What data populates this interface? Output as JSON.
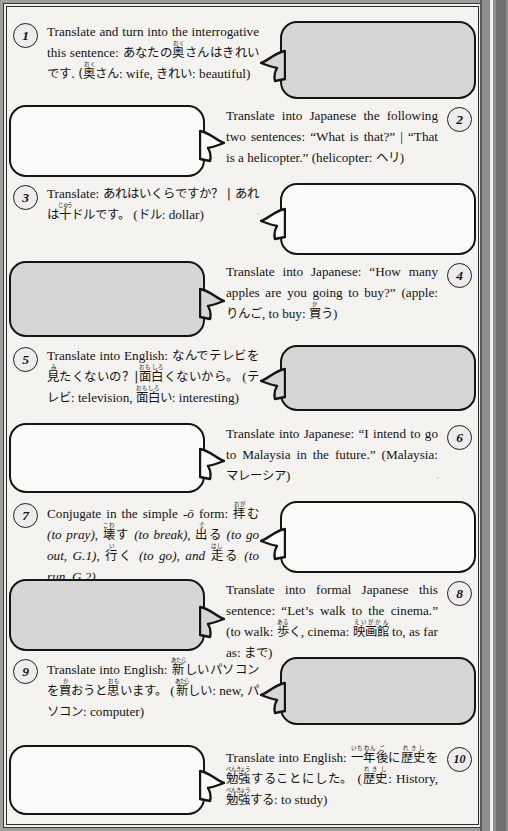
{
  "worksheet": {
    "title": "Japanese translation exercises",
    "bubble_fill_gray": "#d6d6d6",
    "bubble_fill_white": "#fbfbfa",
    "ink_color": "#151515",
    "page_background": "#f4f3f0"
  },
  "items": [
    {
      "number": "1",
      "side": "left",
      "bubble_fill": "gray",
      "answer_text": "",
      "prompt_html": "Translate and turn into the interrogative this sentence: <span class=\"jp\">あなたの<ruby>奥<rt>おく</rt></ruby>さんはきれいです.</span> <span class=\"jp\">(<ruby>奥<rt>おく</rt></ruby>さん</span>: wife, <span class=\"jp\">きれい</span>: beautiful)"
    },
    {
      "number": "2",
      "side": "right",
      "bubble_fill": "white",
      "answer_text": "",
      "prompt_html": "Translate into Japanese the following two sentences: &ldquo;What is that?&rdquo; | &ldquo;That is a helicopter.&rdquo; (helicopter: <span class=\"jp\">ヘリ</span>)"
    },
    {
      "number": "3",
      "side": "left",
      "bubble_fill": "white",
      "answer_text": "",
      "prompt_html": "Translate: <span class=\"jp\">あれはいくらですか？ | あれは<ruby>十<rt>じゅう</rt></ruby>ドルです。</span> (<span class=\"jp\">ドル</span>: dollar)"
    },
    {
      "number": "4",
      "side": "right",
      "bubble_fill": "gray",
      "answer_text": "",
      "prompt_html": "Translate into Japanese: &ldquo;How many apples are you going to buy?&rdquo; (apple: <span class=\"jp\">りんご</span>, to buy: <span class=\"jp\"><ruby>買<rt>か</rt></ruby>う</span>)"
    },
    {
      "number": "5",
      "side": "left",
      "bubble_fill": "gray",
      "answer_text": "",
      "prompt_html": "Translate into English: <span class=\"jp\">なんでテレビを<ruby>見<rt>み</rt></ruby>たくないの？|<ruby>面白<rt>おもしろ</rt></ruby>くないから。</span> (<span class=\"jp\">テレビ</span>: television, <span class=\"jp\"><ruby>面白<rt>おもしろ</rt></ruby>い</span>: interesting)"
    },
    {
      "number": "6",
      "side": "right",
      "bubble_fill": "white",
      "answer_text": "",
      "prompt_html": "Translate into Japanese: &ldquo;I intend to go to Malaysia in the future.&rdquo; (Malaysia: <span class=\"jp\">マレーシア</span>)"
    },
    {
      "number": "7",
      "side": "left",
      "bubble_fill": "white",
      "answer_text": "",
      "prompt_html": "Conjugate in the simple <span class=\"it\">-ō</span> form: <span class=\"jp\"><ruby>拝<rt>おが</rt></ruby>む</span> <span class=\"it\">(to pray)</span>, <span class=\"jp\"><ruby>壊<rt>こわ</rt></ruby>す</span> <span class=\"it\">(to break)</span>, <span class=\"jp\"><ruby>出<rt>で</rt></ruby>る</span> <span class=\"it\">(to go out, G.1)</span>, <span class=\"jp\"><ruby>行<rt>い</rt></ruby>く</span> <span class=\"it\">(to go), and</span> <span class=\"jp\"><ruby>走<rt>はし</rt></ruby>る</span> <span class=\"it\">(to run, G.2)</span>."
    },
    {
      "number": "8",
      "side": "right",
      "bubble_fill": "gray",
      "answer_text": "",
      "prompt_html": "Translate into formal Japanese this sentence: &ldquo;Let&rsquo;s walk to the cinema.&rdquo; (to walk: <span class=\"jp\"><ruby>歩<rt>ある</rt></ruby>く</span>, cinema: <span class=\"jp\"><ruby>映画館<rt>えいがかん</rt></ruby></span> to, as far as: <span class=\"jp\">まで</span>)"
    },
    {
      "number": "9",
      "side": "left",
      "bubble_fill": "gray",
      "answer_text": "",
      "prompt_html": "Translate into English: <span class=\"jp\"><ruby>新<rt>あたら</rt></ruby>しいパソコンを<ruby>買<rt>か</rt></ruby>おうと<ruby>思<rt>おも</rt></ruby>います。</span> (<span class=\"jp\"><ruby>新<rt>あたら</rt></ruby>しい</span>: new, <span class=\"jp\">パソコン</span>: computer)"
    },
    {
      "number": "10",
      "side": "right",
      "bubble_fill": "white",
      "answer_text": "",
      "prompt_html": "Translate into English: <span class=\"jp\"><ruby>一年<rt>いちねん</rt></ruby><ruby>後<rt>ご</rt></ruby>に<ruby>歴史<rt>れきし</rt></ruby>を<ruby>勉強<rt>べんきょう</rt></ruby>することにした。</span> (<span class=\"jp\"><ruby>歴史<rt>れきし</rt></ruby></span>: History, <span class=\"jp\"><ruby>勉強<rt>べんきょう</rt></ruby>する</span>: to study)"
    }
  ],
  "layout": {
    "rows": [
      {
        "top": 14,
        "bubble_h": 78,
        "tail_y": 26
      },
      {
        "top": 98,
        "bubble_h": 72,
        "tail_y": 22
      },
      {
        "top": 176,
        "bubble_h": 72,
        "tail_y": 22
      },
      {
        "top": 254,
        "bubble_h": 76,
        "tail_y": 24
      },
      {
        "top": 338,
        "bubble_h": 66,
        "tail_y": 20
      },
      {
        "top": 416,
        "bubble_h": 70,
        "tail_y": 22
      },
      {
        "top": 494,
        "bubble_h": 72,
        "tail_y": 24
      },
      {
        "top": 572,
        "bubble_h": 72,
        "tail_y": 24
      },
      {
        "top": 650,
        "bubble_h": 68,
        "tail_y": 22
      },
      {
        "top": 738,
        "bubble_h": 70,
        "tail_y": 22
      }
    ]
  }
}
